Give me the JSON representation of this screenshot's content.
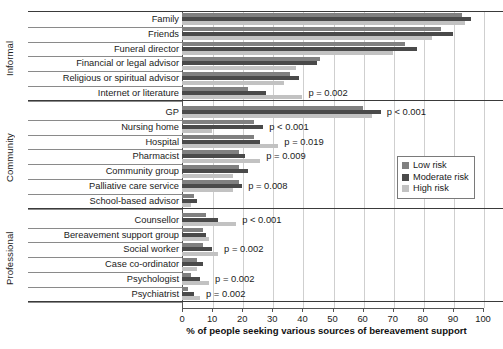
{
  "chart_data": {
    "type": "bar",
    "orientation": "horizontal",
    "title": "",
    "xlabel": "% of people seeking various sources of bereavement support",
    "ylabel": "",
    "xlim": [
      0,
      100
    ],
    "xticks": [
      0,
      10,
      20,
      30,
      40,
      50,
      60,
      70,
      80,
      90,
      100
    ],
    "grid": true,
    "legend_position": "right",
    "series": [
      {
        "name": "Low risk",
        "color": "#808080"
      },
      {
        "name": "Moderate risk",
        "color": "#4a4a4a"
      },
      {
        "name": "High risk",
        "color": "#c2c2c2"
      }
    ],
    "groups": [
      {
        "name": "Informal",
        "categories": [
          {
            "label": "Family",
            "low": 93,
            "moderate": 96,
            "high": 94,
            "pvalue": ""
          },
          {
            "label": "Friends",
            "low": 86,
            "moderate": 90,
            "high": 83,
            "pvalue": ""
          },
          {
            "label": "Funeral director",
            "low": 74,
            "moderate": 78,
            "high": 70,
            "pvalue": ""
          },
          {
            "label": "Financial or legal advisor",
            "low": 46,
            "moderate": 45,
            "high": 38,
            "pvalue": ""
          },
          {
            "label": "Religious or spiritual advisor",
            "low": 36,
            "moderate": 39,
            "high": 34,
            "pvalue": ""
          },
          {
            "label": "Internet or literature",
            "low": 22,
            "moderate": 28,
            "high": 40,
            "pvalue": "p = 0.002"
          }
        ]
      },
      {
        "name": "Community",
        "categories": [
          {
            "label": "GP",
            "low": 60,
            "moderate": 66,
            "high": 63,
            "pvalue": "p < 0.001"
          },
          {
            "label": "Nursing home",
            "low": 24,
            "moderate": 27,
            "high": 10,
            "pvalue": "p < 0.001"
          },
          {
            "label": "Hospital",
            "low": 24,
            "moderate": 26,
            "high": 32,
            "pvalue": "p = 0.019"
          },
          {
            "label": "Pharmacist",
            "low": 19,
            "moderate": 21,
            "high": 26,
            "pvalue": "p = 0.009"
          },
          {
            "label": "Community group",
            "low": 19,
            "moderate": 22,
            "high": 17,
            "pvalue": ""
          },
          {
            "label": "Palliative care service",
            "low": 19,
            "moderate": 20,
            "high": 17,
            "pvalue": "p = 0.008"
          },
          {
            "label": "School-based advisor",
            "low": 4,
            "moderate": 5,
            "high": 3,
            "pvalue": ""
          }
        ]
      },
      {
        "name": "Professional",
        "categories": [
          {
            "label": "Counsellor",
            "low": 8,
            "moderate": 12,
            "high": 18,
            "pvalue": "p < 0.001"
          },
          {
            "label": "Bereavement support group",
            "low": 7,
            "moderate": 8,
            "high": 9,
            "pvalue": ""
          },
          {
            "label": "Social worker",
            "low": 7,
            "moderate": 10,
            "high": 12,
            "pvalue": "p = 0.002"
          },
          {
            "label": "Case co-ordinator",
            "low": 5,
            "moderate": 7,
            "high": 5,
            "pvalue": ""
          },
          {
            "label": "Psychologist",
            "low": 3,
            "moderate": 6,
            "high": 9,
            "pvalue": "p = 0.002"
          },
          {
            "label": "Psychiatrist",
            "low": 2,
            "moderate": 4,
            "high": 6,
            "pvalue": "p = 0.002"
          }
        ]
      }
    ]
  }
}
